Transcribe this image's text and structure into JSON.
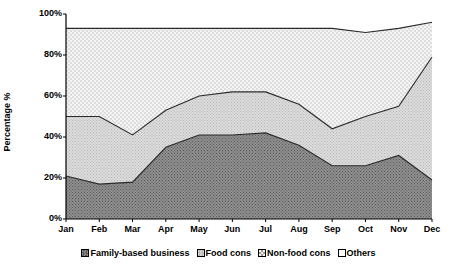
{
  "chart_data": {
    "type": "area",
    "stacked": true,
    "title": "",
    "xlabel": "",
    "ylabel": "Percentage %",
    "categories": [
      "Jan",
      "Feb",
      "Mar",
      "Apr",
      "May",
      "Jun",
      "Jul",
      "Aug",
      "Sep",
      "Oct",
      "Nov",
      "Dec"
    ],
    "ylim": [
      0,
      100
    ],
    "ytick_labels": [
      "0%",
      "20%",
      "40%",
      "60%",
      "80%",
      "100%"
    ],
    "ytick_values": [
      0,
      20,
      40,
      60,
      80,
      100
    ],
    "grid": false,
    "legend_position": "bottom",
    "series": [
      {
        "name": "Family-based business",
        "fill": "dark-hatch",
        "color": "#808080",
        "values": [
          21,
          17,
          18,
          35,
          41,
          41,
          42,
          36,
          26,
          26,
          31,
          19
        ]
      },
      {
        "name": "Food cons",
        "fill": "light-checker",
        "color": "#d4d4d4",
        "values": [
          29,
          33,
          23,
          18,
          19,
          21,
          20,
          20,
          18,
          24,
          24,
          60
        ]
      },
      {
        "name": "Non-food cons",
        "fill": "dotted",
        "color": "#efefef",
        "values": [
          43,
          43,
          52,
          40,
          33,
          31,
          31,
          37,
          49,
          41,
          38,
          17
        ]
      },
      {
        "name": "Others",
        "fill": "white",
        "color": "#ffffff",
        "values": [
          7,
          7,
          7,
          7,
          7,
          7,
          7,
          7,
          7,
          9,
          7,
          4
        ]
      }
    ],
    "cumulative": {
      "family_based_top": [
        21,
        17,
        18,
        35,
        41,
        41,
        42,
        36,
        26,
        26,
        31,
        19
      ],
      "food_cons_top": [
        50,
        50,
        41,
        53,
        60,
        62,
        62,
        56,
        44,
        50,
        55,
        79
      ],
      "nonfood_cons_top": [
        93,
        93,
        93,
        93,
        93,
        93,
        93,
        93,
        93,
        91,
        93,
        96
      ],
      "others_top": [
        100,
        100,
        100,
        100,
        100,
        100,
        100,
        100,
        100,
        100,
        100,
        100
      ]
    }
  },
  "legend": {
    "items": [
      {
        "label": "Family-based business",
        "swatch": "dark-hatch-swatch"
      },
      {
        "label": "Food cons",
        "swatch": "light-checker-swatch"
      },
      {
        "label": "Non-food cons",
        "swatch": "dotted-swatch"
      },
      {
        "label": "Others",
        "swatch": "white-swatch"
      }
    ]
  },
  "axes": {
    "y_title": "Percentage %"
  }
}
